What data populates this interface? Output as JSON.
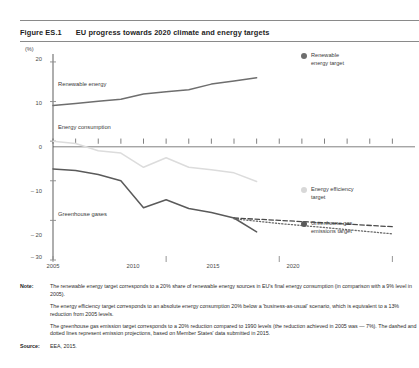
{
  "figure": {
    "number": "Figure ES.1",
    "title": "EU progress towards 2020 climate and energy targets"
  },
  "notes": {
    "note_label": "Note:",
    "paragraphs": [
      "The renewable energy target corresponds to a 20% share of renewable energy sources in EU's final energy consumption (in comparison with a 9% level in 2005).",
      "The energy efficiency target corresponds to an absolute energy consumption 20% below a 'business-as-usual' scenario, which is equivalent to a 13% reduction from 2005 levels.",
      "The greenhouse gas emission target corresponds to a 20% reduction compared to 1990 levels (the reduction achieved in 2005 was — 7%). The dashed and dotted lines represent emission projections, based on Member States' data submitted in 2015."
    ],
    "source_label": "Source:",
    "source_value": "EEA, 2015."
  },
  "legend": {
    "items": [
      {
        "label": "Renewable\nenergy target",
        "color": "#6e6e6e",
        "name": "renewable-energy-target"
      },
      {
        "label": "Energy efficiency\ntarget",
        "color": "#d8d8d8",
        "name": "energy-efficiency-target"
      },
      {
        "label": "Greenhouse gas\nemissions target",
        "color": "#5a5a5a",
        "name": "greenhouse-gas-emissions-target"
      }
    ]
  },
  "chart_data": {
    "type": "line",
    "title": "EU progress towards 2020 climate and energy targets",
    "xlabel": "",
    "ylabel": "(%)",
    "unit": "(%)",
    "xlim": [
      2005,
      2021
    ],
    "ylim": [
      -30,
      22
    ],
    "yticks": [
      20,
      10,
      0,
      -10,
      -20,
      -30
    ],
    "ytick_labels": [
      "20",
      "10",
      "0",
      "– 10",
      "– 20",
      "– 30"
    ],
    "xticks": [
      2005,
      2010,
      2015,
      2020
    ],
    "xtick_labels": [
      "2005",
      "2010",
      "2015",
      "2020"
    ],
    "grid": false,
    "legend_position": "right",
    "series": [
      {
        "name": "Renewable energy",
        "style": "solid",
        "color": "#6e6e6e",
        "inline_label": "Renewable energy",
        "x": [
          2005,
          2006,
          2007,
          2008,
          2009,
          2010,
          2011,
          2012,
          2013,
          2014
        ],
        "values": [
          9.0,
          9.5,
          10.1,
          10.6,
          11.9,
          12.5,
          13.0,
          14.4,
          15.2,
          16.0
        ]
      },
      {
        "name": "Energy consumption",
        "style": "solid",
        "color": "#dcdcdc",
        "inline_label": "Energy consumption",
        "x": [
          2005,
          2006,
          2007,
          2008,
          2009,
          2010,
          2011,
          2012,
          2013,
          2014
        ],
        "values": [
          0.0,
          -0.6,
          -2.4,
          -3.0,
          -6.6,
          -4.2,
          -6.6,
          -7.2,
          -8.0,
          -10.2
        ]
      },
      {
        "name": "Greenhouse gases",
        "style": "solid",
        "color": "#5a5a5a",
        "inline_label": "Greenhouse gases",
        "x": [
          2005,
          2006,
          2007,
          2008,
          2009,
          2010,
          2011,
          2012,
          2013,
          2014
        ],
        "values": [
          -7.0,
          -7.4,
          -8.4,
          -10.0,
          -16.8,
          -14.8,
          -17.0,
          -18.0,
          -19.4,
          -22.9
        ]
      },
      {
        "name": "Emission projection (with existing measures)",
        "style": "dashed",
        "color": "#4a4a4a",
        "x": [
          2013,
          2015,
          2017,
          2020
        ],
        "values": [
          -19.4,
          -20.0,
          -20.6,
          -21.6
        ]
      },
      {
        "name": "Emission projection (with additional measures)",
        "style": "dotted",
        "color": "#6a6a6a",
        "x": [
          2013,
          2015,
          2017,
          2020
        ],
        "values": [
          -19.6,
          -20.8,
          -21.8,
          -23.4
        ]
      }
    ],
    "targets": [
      {
        "name": "Renewable energy target",
        "value": 20,
        "year": 2020,
        "color": "#6e6e6e"
      },
      {
        "name": "Energy efficiency target",
        "value": -13,
        "year": 2020,
        "color": "#d8d8d8"
      },
      {
        "name": "Greenhouse gas emissions target",
        "value": -20,
        "year": 2020,
        "color": "#5a5a5a"
      }
    ]
  }
}
